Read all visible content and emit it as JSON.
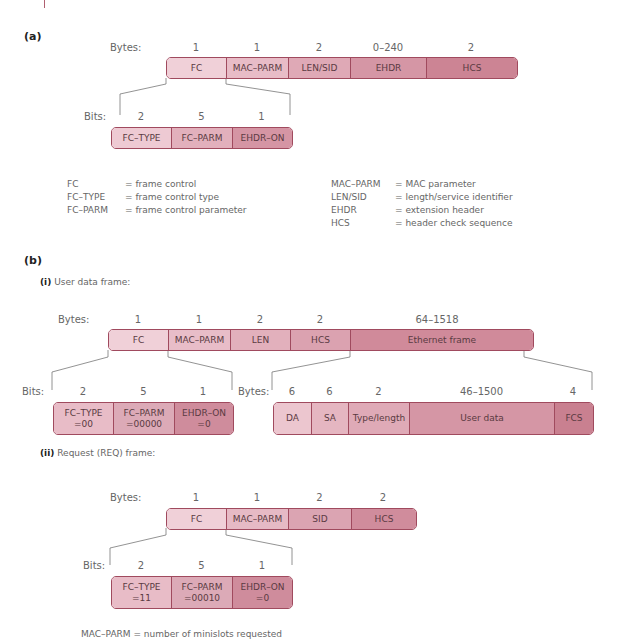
{
  "section_a": {
    "label": "(a)",
    "bytes_label": "Bytes:",
    "byte_counts": [
      "1",
      "1",
      "2",
      "0–240",
      "2"
    ],
    "fields": [
      "FC",
      "MAC–PARM",
      "LEN/SID",
      "EHDR",
      "HCS"
    ],
    "bits_label": "Bits:",
    "bit_counts": [
      "2",
      "5",
      "1"
    ],
    "bit_fields": [
      "FC–TYPE",
      "FC–PARM",
      "EHDR–ON"
    ],
    "legend_left": [
      {
        "key": "FC",
        "value": "= frame control"
      },
      {
        "key": "FC–TYPE",
        "value": "= frame control type"
      },
      {
        "key": "FC–PARM",
        "value": "= frame control parameter"
      }
    ],
    "legend_right": [
      {
        "key": "MAC–PARM",
        "value": "= MAC parameter"
      },
      {
        "key": "LEN/SID",
        "value": "= length/service identifier"
      },
      {
        "key": "EHDR",
        "value": "= extension header"
      },
      {
        "key": "HCS",
        "value": "= header check sequence"
      }
    ]
  },
  "section_b": {
    "label": "(b)",
    "user_data": {
      "label_bold": "(i)",
      "label_text": " User data frame:",
      "bytes_label": "Bytes:",
      "byte_counts": [
        "1",
        "1",
        "2",
        "2",
        "64–1518"
      ],
      "fields": [
        "FC",
        "MAC–PARM",
        "LEN",
        "HCS",
        "Ethernet frame"
      ],
      "bits_label": "Bits:",
      "bit_counts": [
        "2",
        "5",
        "1"
      ],
      "bit_fields": [
        {
          "name": "FC–TYPE",
          "value": "=00"
        },
        {
          "name": "FC–PARM",
          "value": "=00000"
        },
        {
          "name": "EHDR–ON",
          "value": "=0"
        }
      ],
      "eth_bytes_label": "Bytes:",
      "eth_byte_counts": [
        "6",
        "6",
        "2",
        "46–1500",
        "4"
      ],
      "eth_fields": [
        "DA",
        "SA",
        "Type/length",
        "User data",
        "FCS"
      ]
    },
    "request": {
      "label_bold": "(ii)",
      "label_text": " Request (REQ) frame:",
      "bytes_label": "Bytes:",
      "byte_counts": [
        "1",
        "1",
        "2",
        "2"
      ],
      "fields": [
        "FC",
        "MAC–PARM",
        "SID",
        "HCS"
      ],
      "bits_label": "Bits:",
      "bit_counts": [
        "2",
        "5",
        "1"
      ],
      "bit_fields": [
        {
          "name": "FC–TYPE",
          "value": "=11"
        },
        {
          "name": "FC–PARM",
          "value": "=00010"
        },
        {
          "name": "EHDR–ON",
          "value": "=0"
        }
      ],
      "note": "MAC–PARM = number of minislots requested"
    }
  },
  "colors": {
    "border": "#a04a5e",
    "fill_light": "#f2d3da",
    "fill_dark": "#c9788a"
  }
}
